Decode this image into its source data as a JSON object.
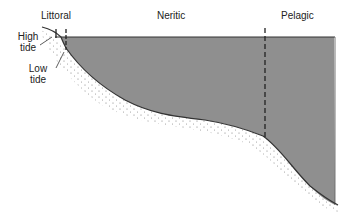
{
  "diagram": {
    "zones": [
      {
        "label": "Littoral"
      },
      {
        "label": "Neritic"
      },
      {
        "label": "Pelagic"
      }
    ],
    "tide_labels": {
      "high_line1": "High",
      "high_line2": "tide",
      "low_line1": "Low",
      "low_line2": "tide"
    },
    "colors": {
      "water": "#8f8f8f",
      "outline": "#333333",
      "sediment_dots": "#666666"
    }
  }
}
